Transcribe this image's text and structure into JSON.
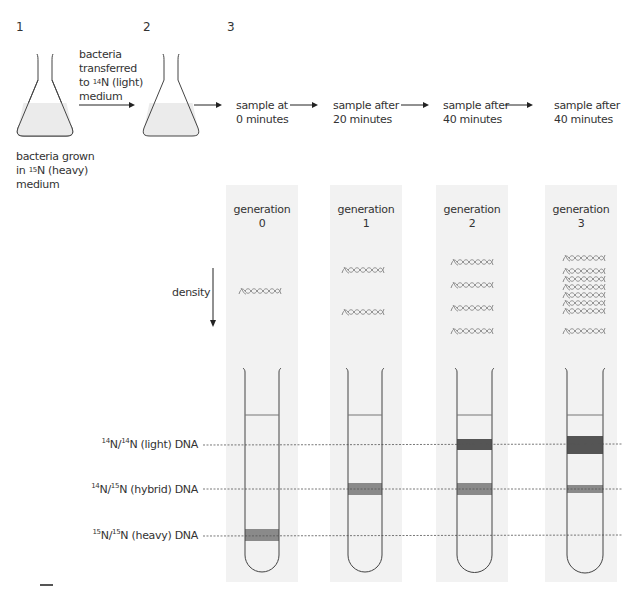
{
  "steps": [
    {
      "number": "1"
    },
    {
      "number": "2"
    },
    {
      "number": "3"
    }
  ],
  "flask1": {
    "caption_line1": "bacteria grown",
    "caption_line2_prefix": "in ",
    "caption_line2_sup": "15",
    "caption_line2_suffix": "N (heavy)",
    "caption_line3": "medium"
  },
  "transfer": {
    "line1": "bacteria",
    "line2": "transferred",
    "line3_prefix": "to ",
    "line3_sup": "14",
    "line3_suffix": "N (light)",
    "line4": "medium"
  },
  "samples": [
    {
      "line1": "sample at",
      "line2": "0 minutes"
    },
    {
      "line1": "sample after",
      "line2": "20 minutes"
    },
    {
      "line1": "sample after",
      "line2": "40 minutes"
    },
    {
      "line1": "sample after",
      "line2": "40 minutes"
    }
  ],
  "density_label": "density",
  "generations": [
    {
      "label": "generation",
      "number": "0",
      "dna_rows": 1,
      "dna_crossed_rows": 0
    },
    {
      "label": "generation",
      "number": "1",
      "dna_rows": 2,
      "dna_crossed_rows": 0
    },
    {
      "label": "generation",
      "number": "2",
      "dna_rows": 4,
      "dna_crossed_rows": 0
    },
    {
      "label": "generation",
      "number": "3",
      "dna_rows": 2,
      "dna_crossed_rows": 6
    }
  ],
  "band_levels": [
    {
      "sup1": "14",
      "mid": "N/",
      "sup2": "14",
      "suffix": "N (light) DNA",
      "key": "light"
    },
    {
      "sup1": "14",
      "mid": "N/",
      "sup2": "15",
      "suffix": "N (hybrid) DNA",
      "key": "hybrid"
    },
    {
      "sup1": "15",
      "mid": "N/",
      "sup2": "15",
      "suffix": "N (heavy) DNA",
      "key": "heavy"
    }
  ],
  "tubes": [
    {
      "generation": "0",
      "bands": [
        {
          "level": "heavy",
          "intensity": "medium"
        }
      ]
    },
    {
      "generation": "1",
      "bands": [
        {
          "level": "hybrid",
          "intensity": "medium"
        }
      ]
    },
    {
      "generation": "2",
      "bands": [
        {
          "level": "light",
          "intensity": "dark"
        },
        {
          "level": "hybrid",
          "intensity": "medium"
        }
      ]
    },
    {
      "generation": "3",
      "bands": [
        {
          "level": "light",
          "intensity": "darkest"
        },
        {
          "level": "hybrid",
          "intensity": "light"
        }
      ]
    }
  ],
  "colors": {
    "column_bg": "#f2f2f2",
    "flask_fill": "#ebebeb",
    "band_dark": "#555555",
    "band_medium": "#8a8a8a",
    "dna_strand": "#8c8c8c",
    "outline": "#444444"
  }
}
